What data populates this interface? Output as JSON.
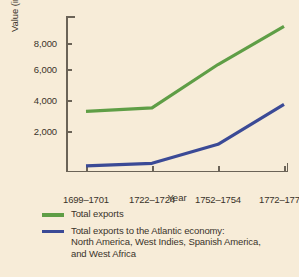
{
  "chart_data": {
    "type": "line",
    "title": "",
    "xlabel": "Year",
    "ylabel": "Value (in thousands of pounds sterling)",
    "categories": [
      "1699–1701",
      "1722–1724",
      "1752–1754",
      "1772–1774"
    ],
    "ylim": [
      0,
      9000
    ],
    "yticks": [
      2000,
      4000,
      6000,
      8000
    ],
    "ytick_labels": [
      "2,000",
      "4,000",
      "6,000",
      "8,000"
    ],
    "grid": false,
    "legend_position": "bottom-left",
    "series": [
      {
        "name": "Total exports",
        "color": "#5f9e46",
        "values": [
          3500,
          3700,
          6200,
          8400
        ]
      },
      {
        "name": "Total exports to the Atlantic economy: North America, West Indies, Spanish America, and West Africa",
        "color": "#3b4a96",
        "values": [
          350,
          500,
          1600,
          3900
        ]
      }
    ]
  },
  "legend": {
    "items": [
      {
        "label": "Total exports",
        "line2": "",
        "line3": "",
        "color": "#5f9e46"
      },
      {
        "label": "Total exports to the Atlantic economy:",
        "line2": "North America, West Indies, Spanish America,",
        "line3": "and West Africa",
        "color": "#3b4a96"
      }
    ]
  },
  "colors": {
    "background": "#f7ecd8",
    "axis": "#6b6357",
    "text": "#3a332a",
    "green": "#5f9e46",
    "blue": "#3b4a96"
  }
}
